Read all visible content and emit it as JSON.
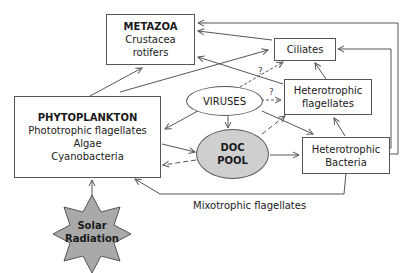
{
  "nodes": {
    "metazoa": {
      "title": "METAZOA",
      "lines": [
        "Crustacea",
        "rotifers"
      ]
    },
    "ciliates": {
      "title": "Ciliates"
    },
    "het_flagellates": {
      "lines": [
        "Heterotrophic",
        "flagellates"
      ]
    },
    "phytoplankton": {
      "title": "PHYTOPLANKTON",
      "lines": [
        "Phototrophic flagellates",
        "Algae",
        "Cyanobacteria"
      ]
    },
    "viruses": {
      "title": "VIRUSES"
    },
    "doc_pool": {
      "lines": [
        "DOC",
        "POOL"
      ],
      "fill": "#cfcfcf"
    },
    "het_bacteria": {
      "lines": [
        "Heterotrophic",
        "Bacteria"
      ]
    },
    "solar": {
      "lines": [
        "Solar",
        "Radiation"
      ],
      "fill": "#a9a9a9"
    }
  },
  "labels": {
    "mixotrophic": "Mixotrophic flagellates",
    "q1": "?",
    "q2": "?"
  },
  "colors": {
    "line": "#555555",
    "star_fill": "#a9a9a9",
    "doc_fill": "#cfcfcf"
  }
}
